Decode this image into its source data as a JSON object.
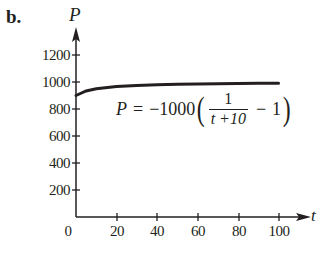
{
  "panel": {
    "label": "b."
  },
  "chart_data": {
    "type": "line",
    "title": "",
    "xlabel": "t",
    "ylabel": "P",
    "xlim": [
      0,
      110
    ],
    "ylim": [
      0,
      1300
    ],
    "grid": false,
    "legend": null,
    "x_ticks": [
      0,
      20,
      40,
      60,
      80,
      100
    ],
    "x_tick_labels": [
      "0",
      "20",
      "40",
      "60",
      "80",
      "100"
    ],
    "y_ticks": [
      200,
      400,
      600,
      800,
      1000,
      1200
    ],
    "y_tick_labels": [
      "200",
      "400",
      "600",
      "800",
      "1000",
      "1200"
    ],
    "series": [
      {
        "name": "P = -1000(1/(t+10) - 1)",
        "x": [
          0,
          5,
          10,
          20,
          30,
          40,
          50,
          60,
          70,
          80,
          90,
          100
        ],
        "y": [
          900,
          933.3,
          950,
          966.7,
          975,
          980,
          983.3,
          985.7,
          987.5,
          988.9,
          990,
          990.9
        ]
      }
    ],
    "annotations": [
      {
        "text": "P = −1000 ( 1/(t+10) − 1 )",
        "position": "below curve, right"
      }
    ]
  },
  "formula": {
    "lhs": "P",
    "equals": "=",
    "coefficient": "−1000",
    "open_paren": "(",
    "numerator": "1",
    "denominator": "t +10",
    "minus": "−",
    "one": "1",
    "close_paren": ")"
  },
  "colors": {
    "ink": "#231f20",
    "background": "#ffffff"
  }
}
